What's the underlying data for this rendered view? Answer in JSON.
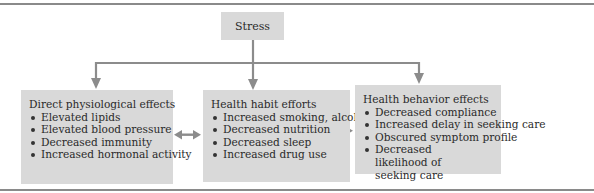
{
  "diagram": {
    "root": {
      "label": "Stress"
    },
    "panels": [
      {
        "title": "Direct physiological effects",
        "items": [
          "Elevated lipids",
          "Elevated blood pressure",
          "Decreased immunity",
          "Increased hormonal activity"
        ]
      },
      {
        "title": "Health habit efforts",
        "items": [
          "Increased smoking, alcohol use",
          "Decreased nutrition",
          "Decreased sleep",
          "Increased drug use"
        ]
      },
      {
        "title": "Health behavior effects",
        "items": [
          "Decreased compliance",
          "Increased delay in seeking care",
          "Obscured symptom profile",
          "Decreased likelihood of seeking care"
        ]
      }
    ],
    "colors": {
      "box": "#d9d9d9",
      "arrow": "#8c8c8c",
      "text": "#2a2a2a"
    }
  }
}
